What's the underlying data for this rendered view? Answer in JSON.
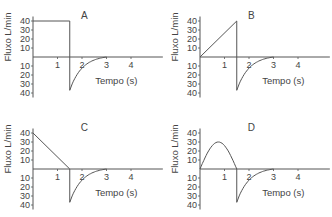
{
  "chart_data": [
    {
      "type": "line",
      "title": "A",
      "xlabel": "Tempo (s)",
      "ylabel": "Fluxo L/min",
      "x_ticks": [
        1,
        2,
        3,
        4
      ],
      "y_ticks_positive": [
        10,
        20,
        30,
        40
      ],
      "y_ticks_negative": [
        10,
        20,
        30,
        40
      ],
      "ylim": [
        -40,
        40
      ],
      "xlim": [
        0,
        5
      ],
      "inspiration": {
        "shape": "square",
        "points": [
          [
            0,
            40
          ],
          [
            1.5,
            40
          ],
          [
            1.5,
            0
          ]
        ]
      },
      "expiration": {
        "shape": "exponential-decay",
        "points": [
          [
            1.5,
            -37
          ],
          [
            2,
            -15
          ],
          [
            2.5,
            -5
          ],
          [
            3,
            0
          ]
        ]
      }
    },
    {
      "type": "line",
      "title": "B",
      "xlabel": "Tempo (s)",
      "ylabel": "Fluxo L/min",
      "x_ticks": [
        1,
        2,
        3,
        4
      ],
      "y_ticks_positive": [
        10,
        20,
        30,
        40
      ],
      "y_ticks_negative": [
        10,
        20,
        30,
        40
      ],
      "ylim": [
        -40,
        40
      ],
      "xlim": [
        0,
        5
      ],
      "inspiration": {
        "shape": "ascending-ramp",
        "points": [
          [
            0,
            0
          ],
          [
            1.5,
            40
          ],
          [
            1.5,
            0
          ]
        ]
      },
      "expiration": {
        "shape": "exponential-decay",
        "points": [
          [
            1.5,
            -37
          ],
          [
            2,
            -15
          ],
          [
            2.5,
            -5
          ],
          [
            3,
            0
          ]
        ]
      }
    },
    {
      "type": "line",
      "title": "C",
      "xlabel": "Tempo (s)",
      "ylabel": "Fluxo L/min",
      "x_ticks": [
        1,
        2,
        3,
        4
      ],
      "y_ticks_positive": [
        10,
        20,
        30,
        40
      ],
      "y_ticks_negative": [
        10,
        20,
        30,
        40
      ],
      "ylim": [
        -40,
        40
      ],
      "xlim": [
        0,
        5
      ],
      "inspiration": {
        "shape": "descending-ramp",
        "points": [
          [
            0,
            40
          ],
          [
            1.5,
            0
          ]
        ]
      },
      "expiration": {
        "shape": "exponential-decay",
        "points": [
          [
            1.5,
            -37
          ],
          [
            2,
            -15
          ],
          [
            2.5,
            -5
          ],
          [
            3,
            0
          ]
        ]
      }
    },
    {
      "type": "line",
      "title": "D",
      "xlabel": "Tempo (s)",
      "ylabel": "Fluxo L/min",
      "x_ticks": [
        1,
        2,
        3,
        4
      ],
      "y_ticks_positive": [
        10,
        20,
        30,
        40
      ],
      "y_ticks_negative": [
        10,
        20,
        30,
        40
      ],
      "ylim": [
        -40,
        40
      ],
      "xlim": [
        0,
        5
      ],
      "inspiration": {
        "shape": "sinusoidal",
        "points": [
          [
            0,
            0
          ],
          [
            0.75,
            30
          ],
          [
            1.5,
            0
          ]
        ]
      },
      "expiration": {
        "shape": "exponential-decay",
        "points": [
          [
            1.5,
            -37
          ],
          [
            2,
            -15
          ],
          [
            2.5,
            -5
          ],
          [
            3,
            0
          ]
        ]
      }
    }
  ],
  "labels": {
    "xlabel": "Tempo (s)",
    "ylabel": "Fluxo L/min",
    "panels": [
      "A",
      "B",
      "C",
      "D"
    ],
    "x_ticks": [
      "1",
      "2",
      "3",
      "4"
    ],
    "y_ticks": [
      "40",
      "30",
      "20",
      "10",
      "10",
      "20",
      "30",
      "40"
    ]
  }
}
